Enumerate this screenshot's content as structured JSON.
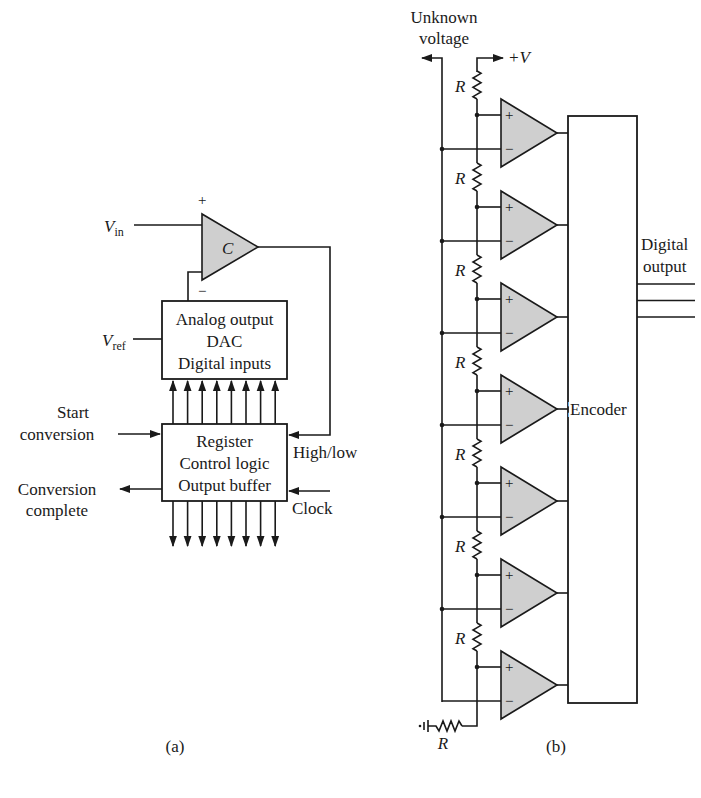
{
  "figure_a": {
    "caption": "(a)",
    "comparator": {
      "label": "C",
      "plus": "+",
      "minus": "−"
    },
    "vin": {
      "main": "V",
      "sub": "in"
    },
    "vref": {
      "main": "V",
      "sub": "ref"
    },
    "dac_box": {
      "lines": [
        "Analog output",
        "DAC",
        "Digital inputs"
      ]
    },
    "register_box": {
      "lines": [
        "Register",
        "Control logic",
        "Output buffer"
      ]
    },
    "start_conversion": [
      "Start",
      "conversion"
    ],
    "conversion_complete": [
      "Conversion",
      "complete"
    ],
    "high_low": "High/low",
    "clock": "Clock",
    "bus_width": 8
  },
  "figure_b": {
    "caption": "(b)",
    "unknown_voltage": [
      "Unknown",
      "voltage"
    ],
    "plus_v": "+V",
    "resistor_label": "R",
    "comparator_count": 7,
    "comparator_plus": "+",
    "comparator_minus": "−",
    "encoder_label": "Encoder",
    "digital_output": [
      "Digital",
      "output"
    ],
    "output_lines": 3
  },
  "colors": {
    "ink": "#1a1a1a",
    "comparator_fill": "#cfcfcf",
    "background": "#ffffff"
  }
}
